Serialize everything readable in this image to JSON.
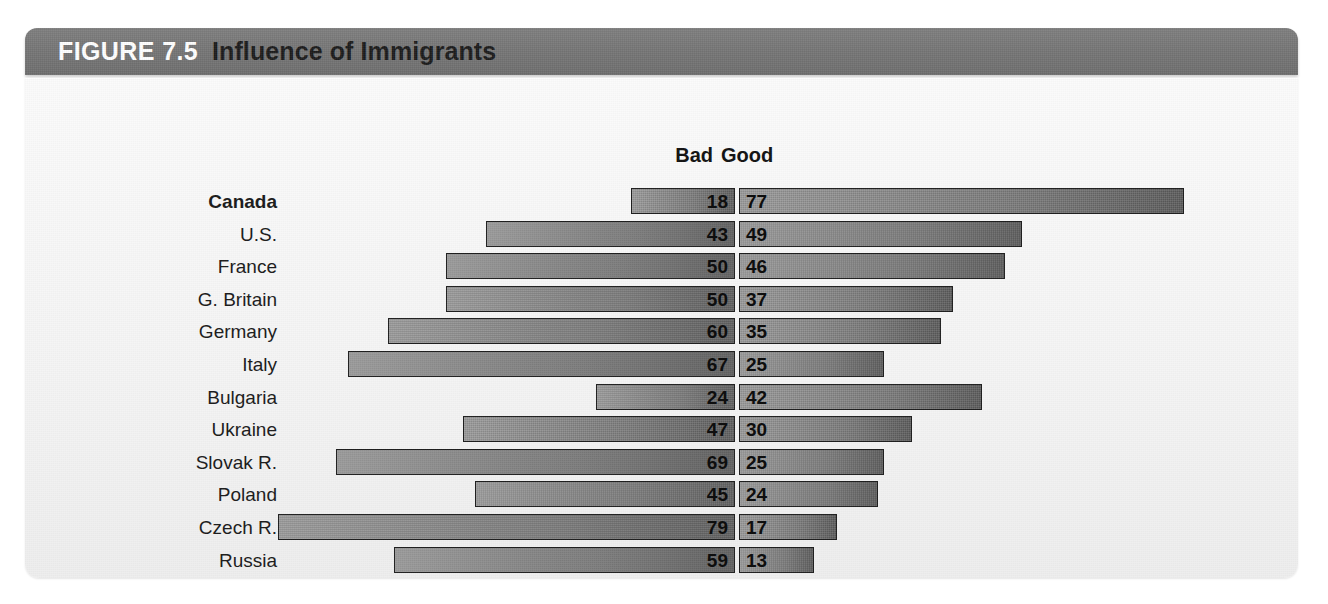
{
  "figure": {
    "number_label": "FIGURE 7.5",
    "title": "Influence of Immigrants"
  },
  "colors": {
    "band_background": "#757575",
    "band_number_text": "#ffffff",
    "band_title_text": "#1b1b1b",
    "panel_background": "#f5f5f5",
    "bar_light": "#9b9b9b",
    "bar_dark": "#5f5f5f",
    "bar_outline": "#1d1d1d",
    "value_text": "#0e0e0e"
  },
  "legend": {
    "left_label": "Bad",
    "right_label": "Good"
  },
  "chart_data": {
    "type": "bar",
    "subtype": "diverging-horizontal-bar",
    "title": "Influence of Immigrants",
    "xlabel": "",
    "ylabel": "",
    "grid": false,
    "legend_position": "top-center",
    "axis_max": 80,
    "value_unit": "percent",
    "categories": [
      "Canada",
      "U.S.",
      "France",
      "G. Britain",
      "Germany",
      "Italy",
      "Bulgaria",
      "Ukraine",
      "Slovak R.",
      "Poland",
      "Czech R.",
      "Russia"
    ],
    "highlighted_categories": [
      "Canada"
    ],
    "series": [
      {
        "name": "Bad",
        "direction": "left",
        "values": [
          18,
          43,
          50,
          50,
          60,
          67,
          24,
          47,
          69,
          45,
          79,
          59
        ]
      },
      {
        "name": "Good",
        "direction": "right",
        "values": [
          77,
          49,
          46,
          37,
          35,
          25,
          42,
          30,
          25,
          24,
          17,
          13
        ]
      }
    ]
  },
  "layout": {
    "center_x": 712,
    "px_per_unit": 5.78,
    "row_pitch": 32.6,
    "first_row_top": 110,
    "label_right_edge": 252
  }
}
